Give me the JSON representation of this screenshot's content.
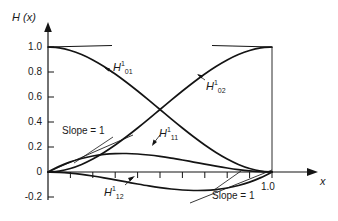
{
  "chart_data": {
    "type": "line",
    "title": "",
    "xlabel": "x",
    "ylabel": "H (x)",
    "xlim": [
      0,
      1.12
    ],
    "ylim": [
      -0.2,
      1.08
    ],
    "grid": false,
    "legend": "none",
    "y_ticks": [
      {
        "value": 1.0,
        "label": "1.0"
      },
      {
        "value": 0.8,
        "label": "0.8"
      },
      {
        "value": 0.6,
        "label": "0.6"
      },
      {
        "value": 0.4,
        "label": "0.4"
      },
      {
        "value": 0.2,
        "label": "0.2"
      },
      {
        "value": 0.0,
        "label": "0"
      },
      {
        "value": -0.2,
        "label": "-0.2"
      }
    ],
    "x_ticks": [
      {
        "value": 0.1,
        "label": ""
      },
      {
        "value": 0.2,
        "label": ""
      },
      {
        "value": 0.3,
        "label": ""
      },
      {
        "value": 0.4,
        "label": ""
      },
      {
        "value": 0.5,
        "label": ""
      },
      {
        "value": 0.6,
        "label": ""
      },
      {
        "value": 0.7,
        "label": ""
      },
      {
        "value": 0.8,
        "label": ""
      },
      {
        "value": 0.9,
        "label": ""
      },
      {
        "value": 1.0,
        "label": "1.0"
      }
    ],
    "x": [
      0,
      0.05,
      0.1,
      0.15,
      0.2,
      0.25,
      0.3,
      0.35,
      0.4,
      0.45,
      0.5,
      0.55,
      0.6,
      0.65,
      0.7,
      0.75,
      0.8,
      0.85,
      0.9,
      0.95,
      1.0
    ],
    "series": [
      {
        "name": "H01",
        "label_base": "H",
        "label_sup": "1",
        "label_sub": "01",
        "color": "#141414",
        "values": [
          1.0,
          0.99275,
          0.972,
          0.93925,
          0.896,
          0.84375,
          0.784,
          0.71825,
          0.648,
          0.57475,
          0.5,
          0.42525,
          0.352,
          0.28175,
          0.216,
          0.15625,
          0.104,
          0.06075,
          0.028,
          0.00725,
          0.0
        ]
      },
      {
        "name": "H02",
        "label_base": "H",
        "label_sup": "1",
        "label_sub": "02",
        "color": "#141414",
        "values": [
          0.0,
          0.00725,
          0.028,
          0.06075,
          0.104,
          0.15625,
          0.216,
          0.28175,
          0.352,
          0.42525,
          0.5,
          0.57475,
          0.648,
          0.71825,
          0.784,
          0.84375,
          0.896,
          0.93925,
          0.972,
          0.99275,
          1.0
        ]
      },
      {
        "name": "H11",
        "label_base": "H",
        "label_sup": "1",
        "label_sub": "11",
        "color": "#141414",
        "values": [
          0.0,
          0.045125,
          0.081,
          0.108375,
          0.128,
          0.140625,
          0.147,
          0.147875,
          0.144,
          0.136125,
          0.125,
          0.111375,
          0.096,
          0.079625,
          0.063,
          0.046875,
          0.032,
          0.019125,
          0.009,
          0.002375,
          0.0
        ]
      },
      {
        "name": "H12",
        "label_base": "H",
        "label_sup": "1",
        "label_sub": "12",
        "color": "#141414",
        "values": [
          0.0,
          -0.002375,
          -0.009,
          -0.019125,
          -0.032,
          -0.046875,
          -0.063,
          -0.079625,
          -0.096,
          -0.111375,
          -0.125,
          -0.136125,
          -0.144,
          -0.147875,
          -0.147,
          -0.140625,
          -0.128,
          -0.108375,
          -0.081,
          -0.045125,
          0.0
        ]
      }
    ],
    "annotations": [
      {
        "name": "slope-1-left",
        "text": "Slope = 1"
      },
      {
        "name": "slope-1-right",
        "text": "Slope = 1"
      }
    ],
    "tangent_markers": [
      {
        "name": "tangent-top-left",
        "note": "horizontal segment at H=1.0 from x=0"
      },
      {
        "name": "tangent-top-right",
        "note": "horizontal segment at H=1.0 ending at x=1.0"
      },
      {
        "name": "tangent-slope-left",
        "note": "unit slope line from origin"
      },
      {
        "name": "tangent-slope-right",
        "note": "unit slope line into x=1.0"
      }
    ],
    "vertical_line_at_x1": true
  },
  "axis": {
    "y_title": "H (x)",
    "x_title": "x"
  }
}
